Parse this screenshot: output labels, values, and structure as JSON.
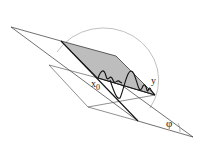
{
  "diagram": {
    "labels": {
      "x0_main": "x",
      "x0_sub": "0",
      "y": "y",
      "phi": "φ"
    },
    "colors": {
      "line": "#1a1a1a",
      "thin_line": "#444444",
      "shaded_plane": "#bdbdbd",
      "arc": "#b0b0b0",
      "background": "#ffffff"
    }
  }
}
